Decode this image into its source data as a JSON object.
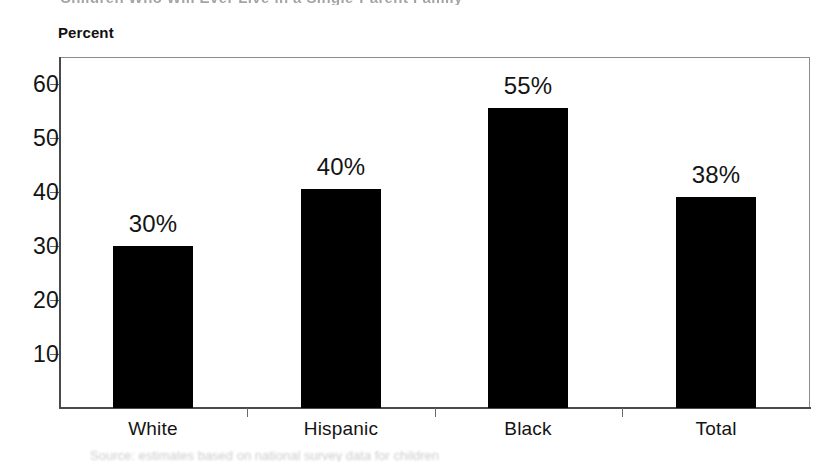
{
  "scan": {
    "top_text_fragment": "Children Who Will Ever Live in a Single-Parent Family",
    "bottom_text_fragment": "Source: estimates based on national survey data for children"
  },
  "chart_data": {
    "type": "bar",
    "title": "",
    "axis_title": "Percent",
    "xlabel": "",
    "ylabel": "Percent",
    "categories": [
      "White",
      "Hispanic",
      "Black",
      "Total"
    ],
    "values": [
      30,
      40,
      55,
      38
    ],
    "bar_heights_plotted": [
      30.0,
      40.5,
      55.5,
      39.0
    ],
    "data_labels": [
      "30%",
      "40%",
      "55%",
      "38%"
    ],
    "ylim": [
      0,
      65
    ],
    "yticks": [
      10,
      20,
      30,
      40,
      50,
      60
    ],
    "ytick_labels": [
      "10",
      "20",
      "30",
      "40",
      "50",
      "60"
    ],
    "grid": false,
    "legend": false,
    "legend_position": "none",
    "bar_color": "#000000",
    "frame_color": "#8d8d8d",
    "axis_color": "#4a4a4a",
    "text_color": "#141414"
  }
}
